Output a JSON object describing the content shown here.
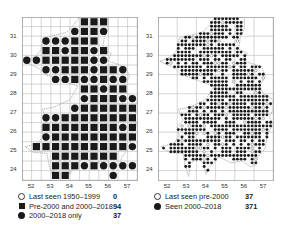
{
  "maps": [
    {
      "id": "left",
      "resolution": "10km",
      "y_ticks": [
        "31",
        "30",
        "29",
        "28",
        "27",
        "26",
        "25",
        "24"
      ],
      "x_ticks": [
        "52",
        "53",
        "54",
        "55",
        "56",
        "57"
      ],
      "grid": [
        "......SSS...",
        ".....CSSC...",
        "..CCCSSS....",
        "..SSCSSCS...",
        "CCSSSSSCC...",
        "..CCSSSCSSC.",
        "...CCSCCSCC.",
        "......SSCSS.",
        "......CSSSCCC",
        ".....CSSSSSSS",
        "..CCSSSSSSSSS",
        "..SSSSSSSSCS",
        "..CSSSSSSSSS",
        ".SSSSSSSSSSC",
        "...SSSSSSS..",
        "...SSSCSCCCC",
        "...SS....C.."
      ],
      "legend": [
        {
          "symbol": "open-circle",
          "label": "Last seen 1950–1999",
          "count": "0"
        },
        {
          "symbol": "square",
          "label": "Pre-2000 and 2000–2018",
          "count": "94"
        },
        {
          "symbol": "filled-circle",
          "label": "2000–2018 only",
          "count": "37"
        }
      ]
    },
    {
      "id": "right",
      "resolution": "tetrad",
      "y_ticks": [
        "31",
        "30",
        "29",
        "28",
        "27",
        "26",
        "25",
        "24"
      ],
      "x_ticks": [
        "52",
        "53",
        "54",
        "55",
        "56",
        "57"
      ],
      "legend": [
        {
          "symbol": "open-circle",
          "label": "Last seen pre-2000",
          "count": "37"
        },
        {
          "symbol": "filled-circle",
          "label": "Seen 2000–2018",
          "count": "371"
        }
      ]
    }
  ],
  "colors": {
    "ink": "#1a1a1a",
    "grid": "#b8b8b8",
    "frame": "#9a9a9a",
    "coast": "#8a8a8a"
  }
}
